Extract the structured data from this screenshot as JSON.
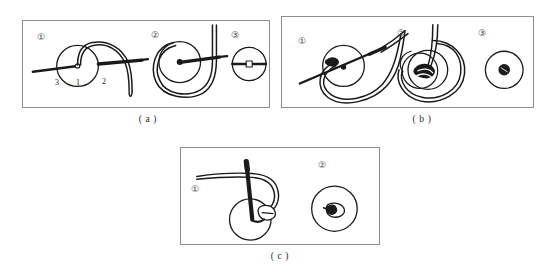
{
  "figure": {
    "background_color": "#fefefe",
    "line_color": "#1a1a1a",
    "border_color": "#8d8d8d"
  },
  "panels": [
    {
      "id": "a",
      "caption": "( a )",
      "steps": [
        {
          "mark": "①",
          "note": "needle passes through button hole 1, thread loop over"
        },
        {
          "mark": "②",
          "note": "thread wrapped around forming loop under button"
        },
        {
          "mark": "③",
          "note": "finished knot seen from top of button"
        }
      ],
      "thread_labels": [
        {
          "text": "3",
          "meaning": "thread tail end"
        },
        {
          "text": "1",
          "meaning": "button hole center"
        },
        {
          "text": "2",
          "meaning": "working thread"
        }
      ]
    },
    {
      "id": "b",
      "caption": "( b )",
      "steps": [
        {
          "mark": "①",
          "note": "needle enters diagonally, loop formed below button"
        },
        {
          "mark": "②",
          "note": "thread drawn tight forming knot at button"
        },
        {
          "mark": "③",
          "note": "completed knot on button face"
        }
      ],
      "thread_labels": []
    },
    {
      "id": "c",
      "caption": "( c )",
      "steps": [
        {
          "mark": "①",
          "note": "needle vertical through button with thread loop"
        },
        {
          "mark": "②",
          "note": "finished button with knot"
        }
      ],
      "thread_labels": []
    }
  ]
}
